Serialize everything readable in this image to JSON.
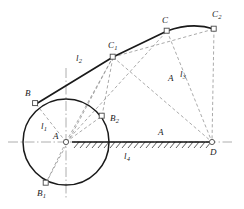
{
  "figure": {
    "type": "geometry-diagram",
    "background_color": "#ffffff",
    "solid_line_color": "#1a1a1a",
    "dashed_line_color": "#8a8a8a",
    "axis_line_color": "#9a9a9a",
    "marker_fill": "#ffffff",
    "marker_stroke": "#555555"
  },
  "points": [
    {
      "id": "A",
      "label": "A",
      "x": 66,
      "y": 142,
      "label_x": 53,
      "label_y": 132,
      "marker": true
    },
    {
      "id": "B",
      "label": "B",
      "x": 36,
      "y": 104,
      "label_x": 25,
      "label_y": 89,
      "marker": true
    },
    {
      "id": "B1",
      "label": "B",
      "sub": "1",
      "x": 46,
      "y": 183,
      "label_x": 37,
      "label_y": 189,
      "marker": true
    },
    {
      "id": "B2",
      "label": "B",
      "sub": "2",
      "x": 102,
      "y": 116,
      "label_x": 110,
      "label_y": 114,
      "marker": true
    },
    {
      "id": "C",
      "label": "C",
      "x": 167,
      "y": 31,
      "label_x": 162,
      "label_y": 16,
      "marker": true
    },
    {
      "id": "C1",
      "label": "C",
      "sub": "1",
      "x": 113,
      "y": 57,
      "label_x": 108,
      "label_y": 41,
      "marker": true
    },
    {
      "id": "C2",
      "label": "C",
      "sub": "2",
      "x": 214,
      "y": 29,
      "label_x": 212,
      "label_y": 10,
      "marker": true
    },
    {
      "id": "D",
      "label": "D",
      "x": 212,
      "y": 142,
      "label_x": 210,
      "label_y": 148,
      "marker": true
    }
  ],
  "length_labels": [
    {
      "id": "l1",
      "label": "l",
      "sub": "1",
      "x": 41,
      "y": 122
    },
    {
      "id": "l2",
      "label": "l",
      "sub": "2",
      "x": 76,
      "y": 54
    },
    {
      "id": "l3",
      "label": "l",
      "sub": "3",
      "x": 180,
      "y": 70
    },
    {
      "id": "l4",
      "label": "l",
      "sub": "4",
      "x": 124,
      "y": 152
    },
    {
      "id": "A-mid",
      "label": "A",
      "x": 158,
      "y": 128
    },
    {
      "id": "A-upper",
      "label": "A",
      "x": 168,
      "y": 74
    }
  ],
  "circle": {
    "center_x": 66,
    "center_y": 142,
    "radius": 43
  },
  "ground": {
    "start_x": 72,
    "end_x": 212,
    "y": 142,
    "hatch_count": 23
  },
  "axes": {
    "horizontal": {
      "x1": 8,
      "x2": 232,
      "y": 142
    },
    "vertical": {
      "x": 66,
      "y1": 68,
      "y2": 200
    }
  },
  "solid_path": {
    "description": "B to C1 to C straight, C to C2 curved",
    "segments": [
      {
        "from": "B",
        "to": "C1"
      },
      {
        "from": "C1",
        "to": "C"
      },
      {
        "from": "C",
        "to": "C2",
        "curved": true
      }
    ]
  },
  "dashed_links": [
    {
      "from": "A",
      "to": "B"
    },
    {
      "from": "A",
      "to": "B1"
    },
    {
      "from": "A",
      "to": "B2"
    },
    {
      "from": "A",
      "to": "C1"
    },
    {
      "from": "A",
      "to": "C"
    },
    {
      "from": "A",
      "to": "D"
    },
    {
      "from": "B1",
      "to": "C1"
    },
    {
      "from": "B2",
      "to": "C1"
    },
    {
      "from": "C1",
      "to": "D"
    },
    {
      "from": "C",
      "to": "D"
    },
    {
      "from": "C2",
      "to": "D"
    },
    {
      "from": "C1",
      "to": "C2"
    }
  ]
}
